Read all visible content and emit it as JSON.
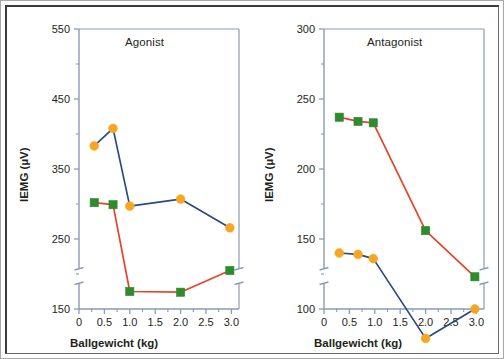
{
  "figure": {
    "panels": [
      {
        "id": "agonist",
        "title": "Agonist",
        "xlabel": "Ballgewicht (kg)",
        "ylabel": "IEMG (µV)",
        "yticks": [
          "550",
          "450",
          "350",
          "250",
          "150"
        ],
        "xticks": [
          "0",
          "0.5",
          "1.0",
          "1.5",
          "2.0",
          "2.5",
          "3.0"
        ]
      },
      {
        "id": "antagonist",
        "title": "Antagonist",
        "xlabel": "Ballgewicht (kg)",
        "ylabel": "IEMG (µV)",
        "yticks": [
          "300",
          "250",
          "200",
          "150",
          "100"
        ],
        "xticks": [
          "0",
          "0.5",
          "1.0",
          "1.5",
          "2.0",
          "2.5",
          "3.0"
        ]
      }
    ]
  },
  "colors": {
    "line_blue": "#2c4a7c",
    "line_red": "#e8432a",
    "marker_orange": "#f6a623",
    "marker_green": "#2e8b2e",
    "axis": "#8a9bb5",
    "text": "#231f20",
    "frame": "#3b3b3b",
    "background": "#ffffff"
  },
  "chart_data": [
    {
      "type": "line",
      "title": "Agonist",
      "xlabel": "Ballgewicht (kg)",
      "ylabel": "IEMG (µV)",
      "xlim": [
        0,
        3.15
      ],
      "ylim": [
        150,
        550
      ],
      "yticks": [
        150,
        250,
        350,
        450,
        550
      ],
      "xticks": [
        0,
        0.5,
        1.0,
        1.5,
        2.0,
        2.5,
        3.0
      ],
      "grid": false,
      "legend": "none",
      "series": [
        {
          "name": "blue-circle-series",
          "marker": "circle",
          "marker_color": "#f6a623",
          "line_color": "#2c4a7c",
          "x": [
            0.3,
            0.67,
            1.0,
            2.0,
            2.97
          ],
          "values": [
            383,
            408,
            297,
            307,
            266
          ]
        },
        {
          "name": "red-square-series",
          "marker": "square",
          "marker_color": "#2e8b2e",
          "line_color": "#e8432a",
          "x": [
            0.3,
            0.67,
            1.0,
            2.0,
            2.97
          ],
          "values": [
            302,
            299,
            175,
            174,
            205
          ]
        }
      ]
    },
    {
      "type": "line",
      "title": "Antagonist",
      "xlabel": "Ballgewicht (kg)",
      "ylabel": "IEMG (µV)",
      "xlim": [
        0,
        3.15
      ],
      "ylim": [
        100,
        300
      ],
      "yticks": [
        100,
        150,
        200,
        250,
        300
      ],
      "xticks": [
        0,
        0.5,
        1.0,
        1.5,
        2.0,
        2.5,
        3.0
      ],
      "grid": false,
      "legend": "none",
      "series": [
        {
          "name": "red-square-series",
          "marker": "square",
          "marker_color": "#2e8b2e",
          "line_color": "#e8432a",
          "x": [
            0.3,
            0.67,
            0.97,
            2.0,
            2.97
          ],
          "values": [
            237,
            234,
            233,
            156,
            123
          ]
        },
        {
          "name": "blue-circle-series",
          "marker": "circle",
          "marker_color": "#f6a623",
          "line_color": "#2c4a7c",
          "x": [
            0.3,
            0.67,
            0.97,
            2.0,
            2.97
          ],
          "values": [
            140,
            139,
            136,
            79,
            100
          ]
        }
      ]
    }
  ]
}
